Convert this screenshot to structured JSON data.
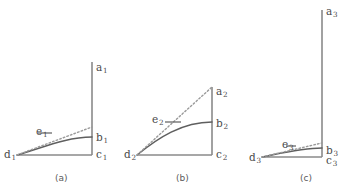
{
  "figure": {
    "panels": [
      {
        "id": "panel-a",
        "caption": "(a)",
        "caption_x": 55,
        "caption_y": 174,
        "origin": {
          "x": 92,
          "y": 155
        },
        "axis_top": {
          "x": 92,
          "y": 62
        },
        "axis_left": {
          "x": 17,
          "y": 155
        },
        "curve_start": {
          "x": 17,
          "y": 155
        },
        "curve_end": {
          "x": 92,
          "y": 137
        },
        "curve_ctrl1": {
          "x": 42,
          "y": 148
        },
        "curve_ctrl2": {
          "x": 66,
          "y": 137
        },
        "tangent_start": {
          "x": 17,
          "y": 155
        },
        "tangent_end": {
          "x": 92,
          "y": 127
        },
        "leader_start": {
          "x": 38,
          "y": 133
        },
        "leader_end": {
          "x": 52,
          "y": 133
        },
        "labels": [
          {
            "name": "label-a1",
            "base": "a",
            "sub": "1",
            "x": 96,
            "y": 62
          },
          {
            "name": "label-b1",
            "base": "b",
            "sub": "1",
            "x": 96,
            "y": 132
          },
          {
            "name": "label-c1",
            "base": "c",
            "sub": "1",
            "x": 96,
            "y": 149
          },
          {
            "name": "label-d1",
            "base": "d",
            "sub": "1",
            "x": 4,
            "y": 149
          },
          {
            "name": "label-e1",
            "base": "e",
            "sub": "1",
            "x": 36,
            "y": 126
          }
        ]
      },
      {
        "id": "panel-b",
        "caption": "(b)",
        "caption_x": 176,
        "caption_y": 174,
        "origin": {
          "x": 212,
          "y": 155
        },
        "axis_top": {
          "x": 212,
          "y": 87
        },
        "axis_left": {
          "x": 137,
          "y": 155
        },
        "curve_start": {
          "x": 137,
          "y": 155
        },
        "curve_end": {
          "x": 212,
          "y": 122
        },
        "curve_ctrl1": {
          "x": 158,
          "y": 138
        },
        "curve_ctrl2": {
          "x": 182,
          "y": 122
        },
        "tangent_start": {
          "x": 137,
          "y": 155
        },
        "tangent_end": {
          "x": 212,
          "y": 87
        },
        "leader_start": {
          "x": 165,
          "y": 122
        },
        "leader_end": {
          "x": 181,
          "y": 122
        },
        "labels": [
          {
            "name": "label-a2",
            "base": "a",
            "sub": "2",
            "x": 216,
            "y": 86
          },
          {
            "name": "label-b2",
            "base": "b",
            "sub": "2",
            "x": 216,
            "y": 118
          },
          {
            "name": "label-c2",
            "base": "c",
            "sub": "2",
            "x": 216,
            "y": 149
          },
          {
            "name": "label-d2",
            "base": "d",
            "sub": "2",
            "x": 124,
            "y": 149
          },
          {
            "name": "label-e2",
            "base": "e",
            "sub": "2",
            "x": 152,
            "y": 114
          }
        ]
      },
      {
        "id": "panel-c",
        "caption": "(c)",
        "caption_x": 300,
        "caption_y": 174,
        "origin": {
          "x": 322,
          "y": 157
        },
        "axis_top": {
          "x": 322,
          "y": 10
        },
        "axis_left": {
          "x": 262,
          "y": 157
        },
        "curve_start": {
          "x": 262,
          "y": 157
        },
        "curve_end": {
          "x": 322,
          "y": 148
        },
        "curve_ctrl1": {
          "x": 282,
          "y": 153
        },
        "curve_ctrl2": {
          "x": 302,
          "y": 148
        },
        "tangent_start": {
          "x": 262,
          "y": 157
        },
        "tangent_end": {
          "x": 322,
          "y": 143
        },
        "leader_start": {
          "x": 286,
          "y": 146
        },
        "leader_end": {
          "x": 296,
          "y": 146
        },
        "labels": [
          {
            "name": "label-a3",
            "base": "a",
            "sub": "3",
            "x": 326,
            "y": 6
          },
          {
            "name": "label-b3",
            "base": "b",
            "sub": "3",
            "x": 326,
            "y": 145
          },
          {
            "name": "label-c3",
            "base": "c",
            "sub": "3",
            "x": 326,
            "y": 155
          },
          {
            "name": "label-d3",
            "base": "d",
            "sub": "3",
            "x": 249,
            "y": 152
          },
          {
            "name": "label-e3",
            "base": "e",
            "sub": "3",
            "x": 282,
            "y": 139
          }
        ]
      }
    ],
    "colors": {
      "axis": "#8a8a8a",
      "curve": "#5f5f5f",
      "tangent": "#9a9a9a",
      "label_text": "#4a4a4a",
      "caption_text": "#5a5a5a",
      "background": "#ffffff"
    }
  }
}
